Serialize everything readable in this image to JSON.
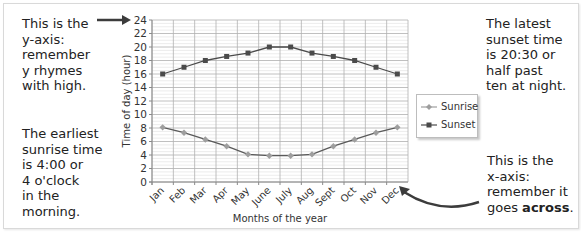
{
  "notes": {
    "y_axis": "This is the\ny-axis:\nremember\ny rhymes\nwith high.",
    "sunrise": "The earliest\nsunrise time\nis 4:00 or\n4 o'clock\nin the\nmorning.",
    "sunset": "The latest\nsunset time\nis 20:30 or\nhalf past\nten at night.",
    "x_axis_prefix": "This is the\nx-axis:\nremember it\ngoes ",
    "x_axis_bold": "across",
    "x_axis_suffix": "."
  },
  "colors": {
    "sunrise": "#9e9e9e",
    "sunset": "#4a4a4a",
    "grid_major": "#b0b0b0",
    "grid_minor": "#d9d9d9",
    "arrow": "#3c3c3c"
  },
  "chart_data": {
    "type": "line",
    "title": "",
    "xlabel": "Months of the year",
    "ylabel": "Time of day (hour)",
    "categories": [
      "Jan",
      "Feb",
      "Mar",
      "Apr",
      "May",
      "June",
      "July",
      "Aug",
      "Sept",
      "Oct",
      "Nov",
      "Dec"
    ],
    "ylim": [
      0,
      24
    ],
    "yticks": [
      0,
      2,
      4,
      6,
      8,
      10,
      12,
      14,
      16,
      18,
      20,
      22,
      24
    ],
    "minor_step": 0.5,
    "grid": true,
    "legend": "right",
    "series": [
      {
        "name": "Sunrise",
        "marker": "diamond",
        "values": [
          8.1,
          7.3,
          6.3,
          5.3,
          4.1,
          3.9,
          3.9,
          4.1,
          5.3,
          6.3,
          7.3,
          8.1
        ]
      },
      {
        "name": "Sunset",
        "marker": "square",
        "values": [
          16,
          17,
          18,
          18.6,
          19.1,
          20,
          20,
          19.1,
          18.6,
          18,
          17,
          16
        ]
      }
    ]
  }
}
